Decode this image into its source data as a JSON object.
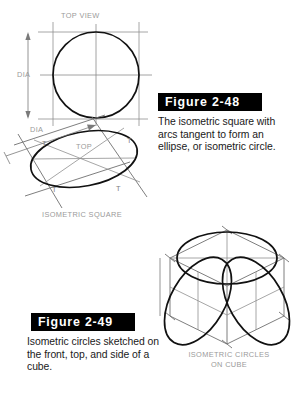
{
  "page": {
    "background_color": "#ffffff",
    "width": 307,
    "height": 409
  },
  "figures": [
    {
      "id": "figure-2-48",
      "banner_label": "Figure 2-48",
      "banner_color": "#000000",
      "banner_text_color": "#ffffff",
      "caption": "The isometric square with arcs tangent to form an ellipse, or isometric circle.",
      "caption_lines": [
        "The isometric square with",
        "arcs tangent to form an",
        "ellipse, or isometric circle."
      ]
    },
    {
      "id": "figure-2-49",
      "banner_label": "Figure 2-49",
      "banner_color": "#000000",
      "banner_text_color": "#ffffff",
      "caption": "Isometric circles sketched on the front, top, and side of a cube.",
      "caption_lines": [
        "Isometric circles sketched on",
        "the front, top, and side of a",
        "cube."
      ]
    }
  ],
  "drawings": {
    "top_view": {
      "title": "TOP VIEW",
      "dimension_label": "DIA",
      "annotation_color": "#9a9a9a"
    },
    "isometric_square": {
      "dimension_label": "DIA",
      "face_label": "TOP",
      "tangent_marks": [
        "T",
        "T",
        "T",
        "T"
      ],
      "caption": "ISOMETRIC SQUARE",
      "annotation_color": "#9a9a9a"
    },
    "isometric_cube": {
      "caption_lines": [
        "ISOMETRIC CIRCLES",
        "ON CUBE"
      ],
      "caption": "ISOMETRIC CIRCLES ON CUBE",
      "annotation_color": "#9a9a9a"
    }
  },
  "colors": {
    "object_line": "#111111",
    "construction_line": "#8f8f8f",
    "dimension_line": "#7a7a7a",
    "annotation_text": "#9a9a9a",
    "caption_text": "#1a1a1a",
    "banner_background": "#000000"
  }
}
